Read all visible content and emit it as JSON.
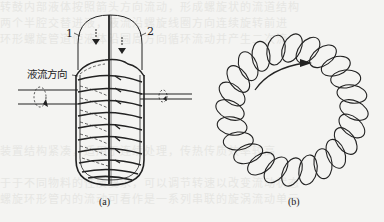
{
  "figure": {
    "panel_a": {
      "caption": "(a)",
      "label_1": "1",
      "label_2": "2",
      "flow_label": "液流方向",
      "description": "rotating drum with two half chambers, helical coil windings, central shaft"
    },
    "panel_b": {
      "caption": "(b)",
      "description": "toroidal helix coil with circulation arrow"
    },
    "colors": {
      "ink": "#222222",
      "paper": "#f4f4f2",
      "bleed_text": "#e6e6e3"
    }
  },
  "background_bleed": [
    "转鼓内部液体按照箭头方向流动，形成螺旋状的流道结构",
    "两个半腔交替进液，液流沿螺旋线圈方向连续旋转前进",
    "环形螺旋管道使液体沿圆周方向循环流动并产生二次流",
    "",
    "",
    "",
    "",
    "",
    "",
    "装置结构紧凑，适用于连续处理，传热传质效率较高",
    "",
    "于于不同物料的性质要求，可以调节转速以改变流动状态",
    "螺旋环形管内的流动可看作是一系列串联的旋涡流动单元"
  ]
}
